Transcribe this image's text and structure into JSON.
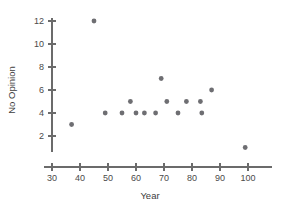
{
  "chart_data": {
    "type": "scatter",
    "title": "",
    "xlabel": "Year",
    "ylabel": "No Opinion",
    "xlim": [
      30,
      103
    ],
    "ylim": [
      0.6,
      12.8
    ],
    "xticks": [
      30,
      40,
      50,
      60,
      70,
      80,
      90,
      100
    ],
    "xtick_labels": [
      "30",
      "40",
      "50",
      "60",
      "70",
      "80",
      "90",
      "100"
    ],
    "yticks": [
      2,
      4,
      6,
      8,
      10,
      12
    ],
    "ytick_labels": [
      "2",
      "4",
      "6",
      "8",
      "10",
      "12"
    ],
    "grid": false,
    "legend": false,
    "marker_color": "#6e6e72",
    "axis_color": "#6b6b6b",
    "points": [
      {
        "x": 37,
        "y": 3
      },
      {
        "x": 45,
        "y": 12
      },
      {
        "x": 49,
        "y": 4
      },
      {
        "x": 55,
        "y": 4
      },
      {
        "x": 58,
        "y": 5
      },
      {
        "x": 60,
        "y": 4
      },
      {
        "x": 63,
        "y": 4
      },
      {
        "x": 67,
        "y": 4
      },
      {
        "x": 69,
        "y": 7
      },
      {
        "x": 71,
        "y": 5
      },
      {
        "x": 75,
        "y": 4
      },
      {
        "x": 78,
        "y": 5
      },
      {
        "x": 83,
        "y": 5
      },
      {
        "x": 83.5,
        "y": 4
      },
      {
        "x": 87,
        "y": 6
      },
      {
        "x": 99,
        "y": 1
      }
    ]
  },
  "axis_titles": {
    "x": "Year",
    "y": "No Opinion"
  }
}
